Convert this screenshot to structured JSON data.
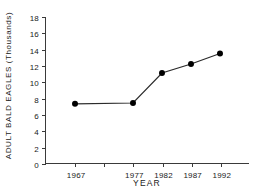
{
  "chart_data": {
    "type": "line",
    "title": "",
    "xlabel": "YEAR",
    "ylabel": "ADULT BALD EAGLES (Thousands)",
    "categories": [
      "1967",
      "1977",
      "1982",
      "1987",
      "1992"
    ],
    "x": [
      1967,
      1977,
      1982,
      1987,
      1992
    ],
    "values": [
      7.3,
      7.4,
      11.1,
      12.2,
      13.5
    ],
    "series": [
      {
        "name": "Adult bald eagles",
        "values": [
          7.3,
          7.4,
          11.1,
          12.2,
          13.5
        ]
      }
    ],
    "xlim": [
      1962,
      1997
    ],
    "ylim": [
      0,
      18
    ],
    "ytick_labels": [
      "0",
      "2",
      "4",
      "6",
      "8",
      "10",
      "12",
      "14",
      "16",
      "18"
    ],
    "ytick_values": [
      0,
      2,
      4,
      6,
      8,
      10,
      12,
      14,
      16,
      18
    ],
    "xtick_labels": [
      "1967",
      "1977",
      "1982",
      "1987",
      "1992"
    ],
    "xtick_values": [
      1967,
      1977,
      1982,
      1987,
      1992
    ],
    "minor_xtick_values": [
      1972
    ],
    "grid": false,
    "legend": "none",
    "marker": "filled-circle",
    "line_color": "#2b2b2b",
    "marker_color": "#000000",
    "axis_color": "#3a3a3a",
    "background": "#ffffff"
  }
}
